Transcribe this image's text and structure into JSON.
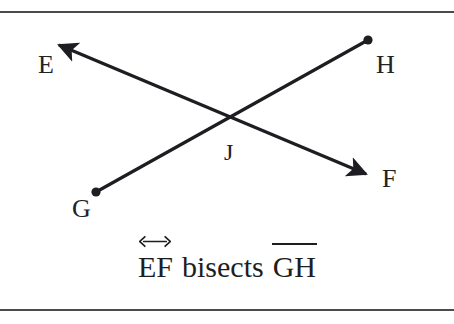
{
  "figure": {
    "background_color": "#ffffff",
    "stroke_color": "#1e1e22",
    "rule_color": "#4a4a4f",
    "points": [
      {
        "id": "E",
        "label": "E",
        "x": 53,
        "y": 40,
        "marker": "arrowhead"
      },
      {
        "id": "F",
        "label": "F",
        "x": 372,
        "y": 178,
        "marker": "arrowhead"
      },
      {
        "id": "G",
        "label": "G",
        "x": 96,
        "y": 192,
        "marker": "dot"
      },
      {
        "id": "H",
        "label": "H",
        "x": 368,
        "y": 40,
        "marker": "dot"
      },
      {
        "id": "J",
        "label": "J",
        "x": 232,
        "y": 119,
        "marker": "none"
      }
    ],
    "shapes": [
      {
        "id": "line-EF",
        "kind": "line",
        "from": "E",
        "to": "F",
        "notation": "double-arrow"
      },
      {
        "id": "segment-GH",
        "kind": "segment",
        "from": "G",
        "to": "H",
        "notation": "endpoints-dots"
      }
    ]
  },
  "caption": {
    "segment_one": "EF",
    "segment_one_notation": "line",
    "verb": "bisects",
    "segment_two": "GH",
    "segment_two_notation": "segment",
    "plain_text": "EF bisects GH"
  }
}
